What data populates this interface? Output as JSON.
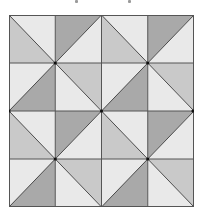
{
  "figure": {
    "type": "quilt-pattern",
    "rows": 4,
    "cols": 4,
    "colors": {
      "light": "#e9e9e9",
      "medium": "#c9c9c9",
      "dark": "#a9a9a9",
      "line": "#3a3a3a"
    },
    "cells": [
      [
        {
          "diag": "tl-br",
          "a": "light",
          "b": "medium"
        },
        {
          "diag": "bl-tr",
          "a": "dark",
          "b": "light"
        },
        {
          "diag": "tl-br",
          "a": "light",
          "b": "medium"
        },
        {
          "diag": "bl-tr",
          "a": "dark",
          "b": "light"
        }
      ],
      [
        {
          "diag": "bl-tr",
          "a": "light",
          "b": "dark"
        },
        {
          "diag": "tl-br",
          "a": "medium",
          "b": "light"
        },
        {
          "diag": "bl-tr",
          "a": "light",
          "b": "dark"
        },
        {
          "diag": "tl-br",
          "a": "medium",
          "b": "light"
        }
      ],
      [
        {
          "diag": "tl-br",
          "a": "light",
          "b": "medium"
        },
        {
          "diag": "bl-tr",
          "a": "dark",
          "b": "light"
        },
        {
          "diag": "tl-br",
          "a": "light",
          "b": "medium"
        },
        {
          "diag": "bl-tr",
          "a": "dark",
          "b": "light"
        }
      ],
      [
        {
          "diag": "bl-tr",
          "a": "light",
          "b": "dark"
        },
        {
          "diag": "tl-br",
          "a": "medium",
          "b": "light"
        },
        {
          "diag": "bl-tr",
          "a": "light",
          "b": "dark"
        },
        {
          "diag": "tl-br",
          "a": "medium",
          "b": "light"
        }
      ]
    ]
  }
}
